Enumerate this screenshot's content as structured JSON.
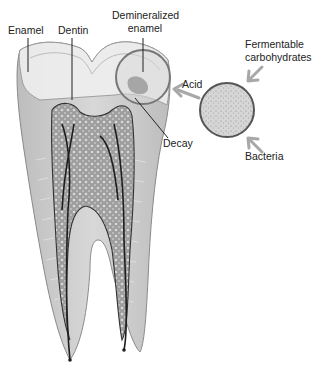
{
  "figure": {
    "labels": {
      "enamel": "Enamel",
      "dentin": "Dentin",
      "demineralized_line1": "Demineralized",
      "demineralized_line2": "enamel",
      "decay": "Decay",
      "acid": "Acid",
      "fermentable_line1": "Fermentable",
      "fermentable_line2": "carbohydrates",
      "bacteria": "Bacteria"
    },
    "colors": {
      "enamel_fill": "#ececec",
      "dentin_fill": "#dcdcdc",
      "pulp_fill": "#a9a9a9",
      "outline": "#555555",
      "arrow": "#a8a8a8",
      "circle_stroke": "#777777",
      "bacteria_fill": "#cfcfcf",
      "nerve": "#1e1e1e"
    }
  }
}
